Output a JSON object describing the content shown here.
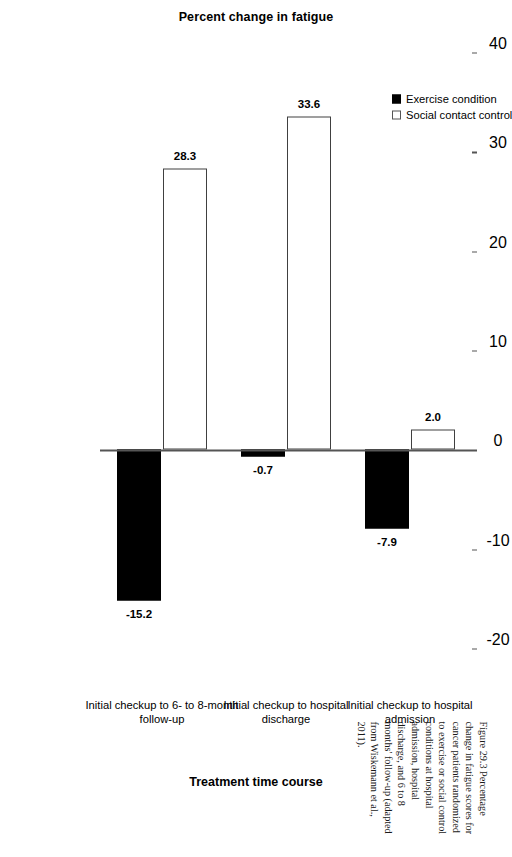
{
  "figure": {
    "caption_number": "Figure 29.3",
    "caption_text": "Percentage change in fatigue scores for cancer patients randomized to exercise or social control conditions at hospital admission, hospital discharge, and 6 to 8 months' follow-up (adapted from Wiskemann et al., 2011)."
  },
  "legend": {
    "position": "top-left",
    "items": [
      {
        "label": "Exercise condition",
        "marker": "filled-square",
        "color": "#000000"
      },
      {
        "label": "Social contact control",
        "marker": "open-square",
        "color": "#ffffff"
      }
    ]
  },
  "axes": {
    "value_axis_title": "Percent change in fatigue",
    "category_axis_title": "Treatment time course",
    "ticks": [
      "40",
      "30",
      "20",
      "10",
      "0",
      "-10",
      "-20"
    ]
  },
  "chart_data": {
    "type": "bar",
    "title": "",
    "subtitle": "",
    "xlabel": "Treatment time course",
    "ylabel": "Percent change in fatigue",
    "ylim": [
      -20,
      40
    ],
    "grid": false,
    "legend_position": "top-left",
    "orientation": "vertical-rotated",
    "categories": [
      "Initial checkup to hospital admission",
      "Initial checkup to hospital discharge",
      "Initial checkup to 6- to 8-month follow-up"
    ],
    "category_lines": [
      [
        "Initial checkup to hospital",
        "admission"
      ],
      [
        "Initial checkup to hospital",
        "discharge"
      ],
      [
        "Initial checkup to 6- to 8-month",
        "follow-up"
      ]
    ],
    "series": [
      {
        "name": "Exercise condition",
        "color": "#000000",
        "values": [
          -7.9,
          -0.7,
          -15.2
        ],
        "labels": [
          "-7.9",
          "-0.7",
          "-15.2"
        ]
      },
      {
        "name": "Social contact control",
        "color": "#ffffff",
        "values": [
          2.0,
          33.6,
          28.3
        ],
        "labels": [
          "2.0",
          "33.6",
          "28.3"
        ]
      }
    ]
  }
}
